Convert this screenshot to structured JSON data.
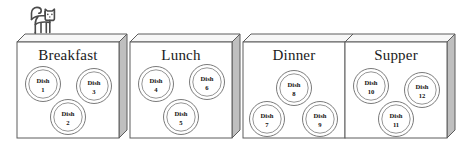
{
  "diagram": {
    "title_text": "",
    "colors": {
      "box_front": "#ffffff",
      "box_top": "#f7f7f7",
      "box_side": "#bfbfbf",
      "outline": "#5c5c5c",
      "dish_stroke": "#6b6b6b",
      "text": "#1a1a1a",
      "cat_stroke": "#4a4a4a",
      "background": "#ffffff"
    },
    "cat": {
      "name": "cat-figure",
      "description": "cat"
    },
    "boxes": [
      {
        "id": "breakfast",
        "label": "Breakfast",
        "dishes": [
          {
            "id": "dish-1",
            "line1": "Dish",
            "line2": "1"
          },
          {
            "id": "dish-3",
            "line1": "Dish",
            "line2": "3"
          },
          {
            "id": "dish-2",
            "line1": "Dish",
            "line2": "2"
          }
        ]
      },
      {
        "id": "lunch",
        "label": "Lunch",
        "dishes": [
          {
            "id": "dish-4",
            "line1": "Dish",
            "line2": "4"
          },
          {
            "id": "dish-6",
            "line1": "Dish",
            "line2": "6"
          },
          {
            "id": "dish-5",
            "line1": "Dish",
            "line2": "5"
          }
        ]
      },
      {
        "id": "dinner",
        "label": "Dinner",
        "dishes": [
          {
            "id": "dish-8",
            "line1": "Dish",
            "line2": "8"
          },
          {
            "id": "dish-7",
            "line1": "Dish",
            "line2": "7"
          },
          {
            "id": "dish-9",
            "line1": "Dish",
            "line2": "9"
          }
        ]
      },
      {
        "id": "supper",
        "label": "Supper",
        "dishes": [
          {
            "id": "dish-10",
            "line1": "Dish",
            "line2": "10"
          },
          {
            "id": "dish-12",
            "line1": "Dish",
            "line2": "12"
          },
          {
            "id": "dish-11",
            "line1": "Dish",
            "line2": "11"
          }
        ]
      }
    ]
  }
}
